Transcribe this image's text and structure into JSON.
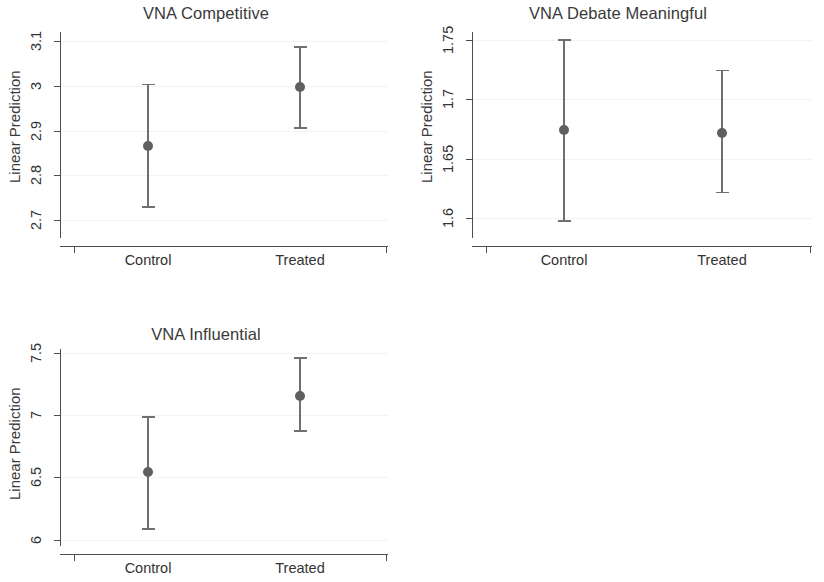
{
  "figure": {
    "ylabel": "Linear Prediction",
    "marker_color": "#5f5f5f",
    "axis_color": "#4d4d4d",
    "grid_color": "#f2f2f2",
    "background": "#ffffff"
  },
  "chart_data": [
    {
      "type": "scatter",
      "title": "VNA Competitive",
      "xlabel": "",
      "ylabel": "Linear Prediction",
      "categories": [
        "Control",
        "Treated"
      ],
      "values": [
        2.866,
        2.998
      ],
      "ci_low": [
        2.731,
        2.908
      ],
      "ci_high": [
        3.005,
        3.088
      ],
      "yticks": [
        "2.7",
        "2.8",
        "2.9",
        "3",
        "3.1"
      ],
      "ytick_values": [
        2.7,
        2.8,
        2.9,
        3.0,
        3.1
      ],
      "ylim": [
        2.66,
        3.12
      ],
      "grid": true,
      "legend": "none",
      "error_type": "95% confidence interval"
    },
    {
      "type": "scatter",
      "title": "VNA Debate Meaningful",
      "xlabel": "",
      "ylabel": "Linear Prediction",
      "categories": [
        "Control",
        "Treated"
      ],
      "values": [
        1.674,
        1.672
      ],
      "ci_low": [
        1.598,
        1.622
      ],
      "ci_high": [
        1.751,
        1.725
      ],
      "yticks": [
        "1.6",
        "1.65",
        "1.7",
        "1.75"
      ],
      "ytick_values": [
        1.6,
        1.65,
        1.7,
        1.75
      ],
      "ylim": [
        1.583,
        1.757
      ],
      "grid": true,
      "legend": "none",
      "error_type": "95% confidence interval"
    },
    {
      "type": "scatter",
      "title": "VNA Influential",
      "xlabel": "",
      "ylabel": "Linear Prediction",
      "categories": [
        "Control",
        "Treated"
      ],
      "values": [
        6.541,
        7.155
      ],
      "ci_low": [
        6.092,
        6.877
      ],
      "ci_high": [
        6.992,
        7.462
      ],
      "yticks": [
        "6",
        "6.5",
        "7",
        "7.5"
      ],
      "ytick_values": [
        6.0,
        6.5,
        7.0,
        7.5
      ],
      "ylim": [
        5.95,
        7.53
      ],
      "grid": true,
      "legend": "none",
      "error_type": "95% confidence interval"
    }
  ]
}
